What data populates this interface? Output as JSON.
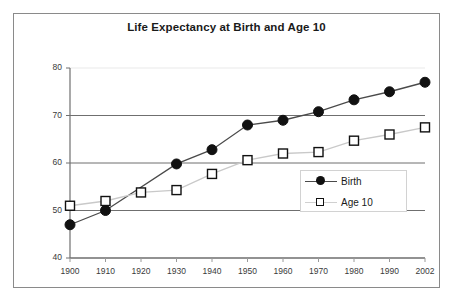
{
  "chart_data": {
    "type": "line",
    "title": "Life Expectancy at Birth and Age 10",
    "xlabel": "",
    "ylabel": "",
    "categories": [
      "1900",
      "1910",
      "1920",
      "1930",
      "1940",
      "1950",
      "1960",
      "1970",
      "1980",
      "1990",
      "2002"
    ],
    "x_tick_labels": [
      "1900",
      "1910",
      "1920",
      "1930",
      "1940",
      "1950",
      "1960",
      "1970",
      "1980",
      "1990",
      "2002"
    ],
    "y_tick_labels": [
      "40",
      "50",
      "60",
      "70",
      "80"
    ],
    "y_ticks": [
      40,
      50,
      60,
      70,
      80
    ],
    "ylim": [
      40,
      80
    ],
    "grid": "horizontal",
    "legend_position": "inside-right",
    "series": [
      {
        "name": "Birth",
        "marker": "filled-circle",
        "color": "#111111",
        "line_color": "#4a4a4a",
        "values": [
          47,
          50,
          null,
          59.8,
          62.8,
          68,
          69,
          70.8,
          73.3,
          75,
          77
        ]
      },
      {
        "name": "Age 10",
        "marker": "open-square",
        "color": "#111111",
        "line_color": "#c9c9c9",
        "values": [
          51,
          52,
          53.8,
          54.3,
          57.7,
          60.6,
          62,
          62.3,
          64.7,
          66,
          67.5
        ]
      }
    ]
  },
  "legend": {
    "entries": [
      {
        "label": "Birth"
      },
      {
        "label": "Age 10"
      }
    ]
  }
}
